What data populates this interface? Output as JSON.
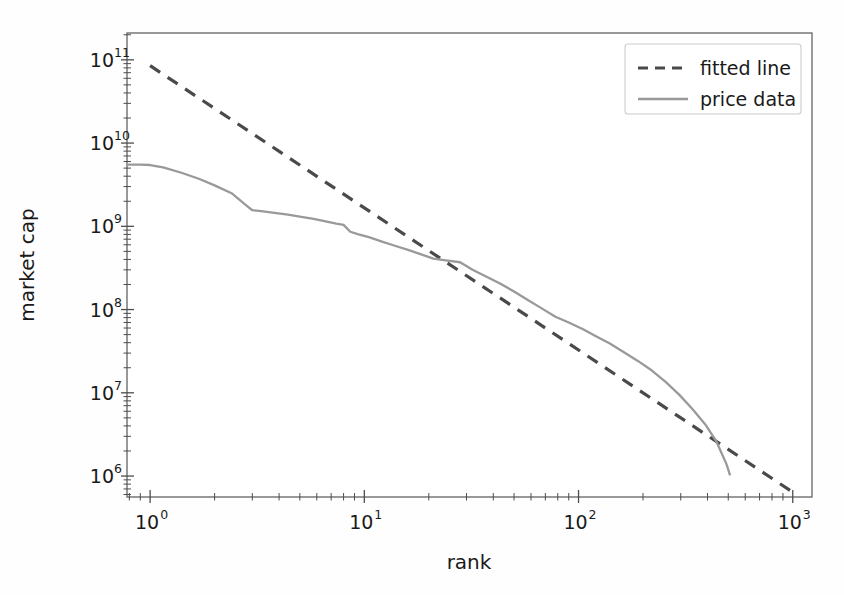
{
  "chart_data": {
    "type": "line",
    "title": "",
    "xlabel": "rank",
    "ylabel": "market cap",
    "xscale": "log",
    "yscale": "log",
    "xlim": [
      0.78,
      1230
    ],
    "ylim": [
      560000,
      210000000000
    ],
    "grid": false,
    "legend_position": "upper right",
    "xticks": [
      1,
      10,
      100,
      1000
    ],
    "xtick_labels": [
      "10^0",
      "10^1",
      "10^2",
      "10^3"
    ],
    "xtick_mantissas": [
      "10",
      "10",
      "10",
      "10"
    ],
    "xtick_exponents": [
      "0",
      "1",
      "2",
      "3"
    ],
    "yticks": [
      1000000,
      10000000,
      100000000,
      1000000000,
      10000000000,
      100000000000
    ],
    "ytick_labels": [
      "10^6",
      "10^7",
      "10^8",
      "10^9",
      "10^10",
      "10^11"
    ],
    "ytick_mantissas": [
      "10",
      "10",
      "10",
      "10",
      "10",
      "10"
    ],
    "ytick_exponents": [
      "6",
      "7",
      "8",
      "9",
      "10",
      "11"
    ],
    "series": [
      {
        "name": "fitted line",
        "style": "dashed",
        "color": "#4a4a4a",
        "linewidth": 3.2,
        "slope": -1.72,
        "intercept_log10": 10.93,
        "x": [
          1,
          1000
        ],
        "y": [
          85000000000,
          640000
        ]
      },
      {
        "name": "price data",
        "style": "solid",
        "color": "#999999",
        "linewidth": 2.3,
        "x": [
          0.78,
          0.9,
          1.0,
          1.15,
          1.4,
          1.7,
          2.0,
          2.4,
          2.8,
          3.0,
          3.3,
          3.8,
          4.4,
          5.0,
          5.8,
          6.6,
          7.4,
          8.0,
          8.6,
          9.4,
          10.5,
          12,
          14,
          16,
          18,
          21,
          24,
          28,
          32,
          37,
          43,
          50,
          58,
          67,
          78,
          90,
          105,
          120,
          140,
          165,
          190,
          220,
          255,
          295,
          340,
          390,
          440,
          490,
          510
        ],
        "y": [
          5500000000,
          5500000000,
          5450000000,
          5100000000,
          4400000000,
          3700000000,
          3100000000,
          2500000000,
          1800000000,
          1560000000,
          1520000000,
          1450000000,
          1380000000,
          1310000000,
          1230000000,
          1150000000,
          1080000000,
          1040000000,
          860000000,
          800000000,
          740000000,
          660000000,
          580000000,
          520000000,
          470000000,
          410000000,
          390000000,
          370000000,
          300000000,
          250000000,
          205000000,
          165000000,
          130000000,
          104000000,
          82000000,
          70000000,
          58000000,
          48000000,
          39000000,
          30000000,
          24000000,
          18500000,
          13500000,
          9500000,
          6400000,
          4200000,
          2600000,
          1400000,
          1020000
        ]
      }
    ]
  },
  "legend": {
    "entries": [
      {
        "label": "fitted line",
        "style": "dashed",
        "color": "#4a4a4a"
      },
      {
        "label": "price data",
        "style": "solid",
        "color": "#999999"
      }
    ]
  },
  "axes": {
    "x_title": "rank",
    "y_title": "market cap"
  },
  "colors": {
    "fitted_line": "#4a4a4a",
    "price_data": "#999999",
    "frame": "#6e6e6e",
    "text": "#1a1a1a",
    "background": "#fefefe"
  }
}
